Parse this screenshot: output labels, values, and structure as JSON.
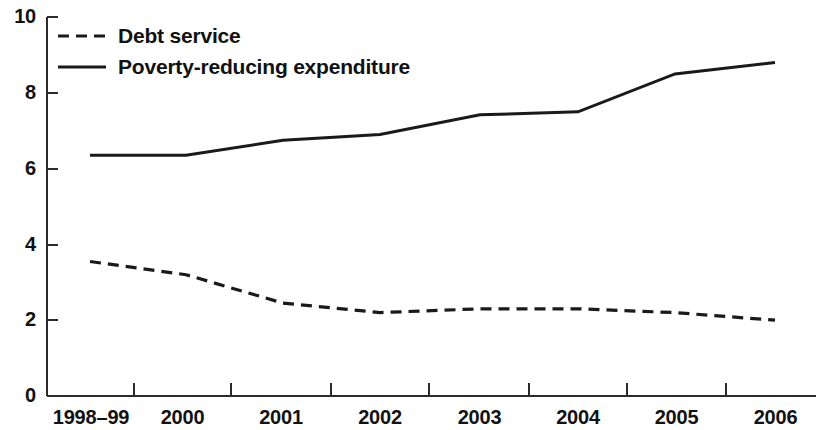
{
  "chart_data": {
    "type": "line",
    "title": "",
    "subtitle": "",
    "xlabel": "",
    "ylabel": "",
    "categories": [
      "1998–99",
      "2000",
      "2001",
      "2002",
      "2003",
      "2004",
      "2005",
      "2006"
    ],
    "series": [
      {
        "name": "Debt service",
        "style": "dashed",
        "color": "#1a1a1a",
        "values": [
          3.55,
          3.2,
          2.45,
          2.2,
          2.3,
          2.3,
          2.2,
          2.0
        ]
      },
      {
        "name": "Poverty-reducing expenditure",
        "style": "solid",
        "color": "#1a1a1a",
        "values": [
          6.35,
          6.35,
          6.75,
          6.9,
          7.42,
          7.5,
          8.5,
          8.8
        ]
      }
    ],
    "ylim": [
      0,
      10
    ],
    "yticks": [
      0,
      2,
      4,
      6,
      8,
      10
    ],
    "ytick_labels": [
      "0",
      "2",
      "4",
      "6",
      "8",
      "10"
    ],
    "grid": false,
    "legend_position": "top-left",
    "axes": {
      "left": true,
      "bottom": true,
      "top": false,
      "right": false
    }
  },
  "legend": {
    "items": [
      {
        "label": "Debt service",
        "style": "dashed"
      },
      {
        "label": "Poverty-reducing expenditure",
        "style": "solid"
      }
    ]
  }
}
